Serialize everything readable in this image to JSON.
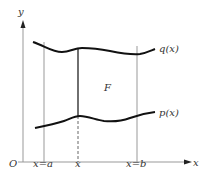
{
  "diagram": {
    "axes": {
      "x_label": "x",
      "y_label": "y",
      "origin_label": "O"
    },
    "curves": [
      {
        "name": "upper-curve",
        "label": "q(x)"
      },
      {
        "name": "lower-curve",
        "label": "p(x)"
      }
    ],
    "region_label": "F",
    "vertical_lines": [
      {
        "name": "x-equals-a",
        "label": "x=a",
        "style": "solid-thin"
      },
      {
        "name": "x-variable",
        "label": "x",
        "style": "solid-bold-between-curves-dashed-below"
      },
      {
        "name": "x-equals-b",
        "label": "x=b",
        "style": "solid-thin"
      }
    ],
    "colors": {
      "line": "#222222",
      "thin_line": "#999999",
      "text": "#333333",
      "background": "#ffffff"
    }
  }
}
